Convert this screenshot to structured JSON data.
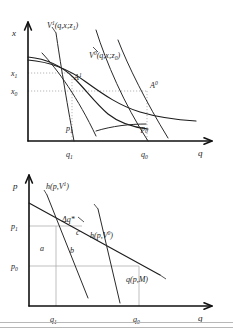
{
  "figure": {
    "name": "hicksian-marshallian-welfare-diagram",
    "panels": [
      {
        "id": "top",
        "name": "indifference-curve-panel",
        "axes": {
          "y_label": "x",
          "x_label": "q",
          "y_ticks": [
            "x1",
            "x0"
          ],
          "x_ticks": [
            "q1",
            "q0"
          ]
        },
        "curves": [
          {
            "name": "indifference-curve-v1",
            "label_base": "V",
            "label_sup": "1",
            "label_args": "(q,x;z",
            "label_sub": "1",
            "label_close": ")"
          },
          {
            "name": "indifference-curve-v0",
            "label_base": "V",
            "label_sup": "0",
            "label_args": "(q,x;z",
            "label_sub": "0",
            "label_close": ")"
          }
        ],
        "budget_lines": [
          {
            "name": "budget-line-p1",
            "label_base": "p",
            "label_sub": "1"
          },
          {
            "name": "budget-line-p0",
            "label_base": "p",
            "label_sub": "0"
          }
        ],
        "points": [
          {
            "name": "tangency-point-a1",
            "label_base": "A",
            "label_sup": "1"
          },
          {
            "name": "tangency-point-a0",
            "label_base": "A",
            "label_sup": "0"
          }
        ]
      },
      {
        "id": "bottom",
        "name": "demand-curve-panel",
        "axes": {
          "y_label": "p",
          "x_label": "q",
          "y_ticks": [
            "p1",
            "p0"
          ],
          "x_ticks": [
            "q1",
            "q0"
          ]
        },
        "curves": [
          {
            "name": "hicksian-demand-v1",
            "label_base": "h(p,V",
            "label_sup": "1",
            "label_close": ")"
          },
          {
            "name": "hicksian-demand-v0",
            "label_base": "h(p,V",
            "label_sup": "0",
            "label_close": ")"
          },
          {
            "name": "marshallian-demand",
            "label": "q(p,M)"
          }
        ],
        "annotations": [
          {
            "name": "delta-q-star-label",
            "text": "Δq*"
          },
          {
            "name": "area-label-a",
            "text": "a"
          },
          {
            "name": "area-label-b",
            "text": "b"
          },
          {
            "name": "area-label-c",
            "text": "c"
          }
        ]
      }
    ]
  },
  "ticks": {
    "x_sub_1": "1",
    "x_sub_0": "0",
    "q_sub_1": "1",
    "q_sub_0": "0",
    "p_sub_1": "1",
    "p_sub_0": "0"
  },
  "glyphs": {
    "x": "x",
    "q": "q",
    "p": "p",
    "V": "V",
    "A": "A",
    "h_open": "h(p,V",
    "paren_close": ")",
    "q_args": "(q,x;z",
    "z": "z",
    "delta_q": "Δq*",
    "area_a": "a",
    "area_b": "b",
    "area_c": "c",
    "marshall": "q(p,M)"
  },
  "colors": {
    "ink": "#1a1a1a",
    "axis": "#111111",
    "guide": "#9a9a9a",
    "background": "#ffffff"
  }
}
